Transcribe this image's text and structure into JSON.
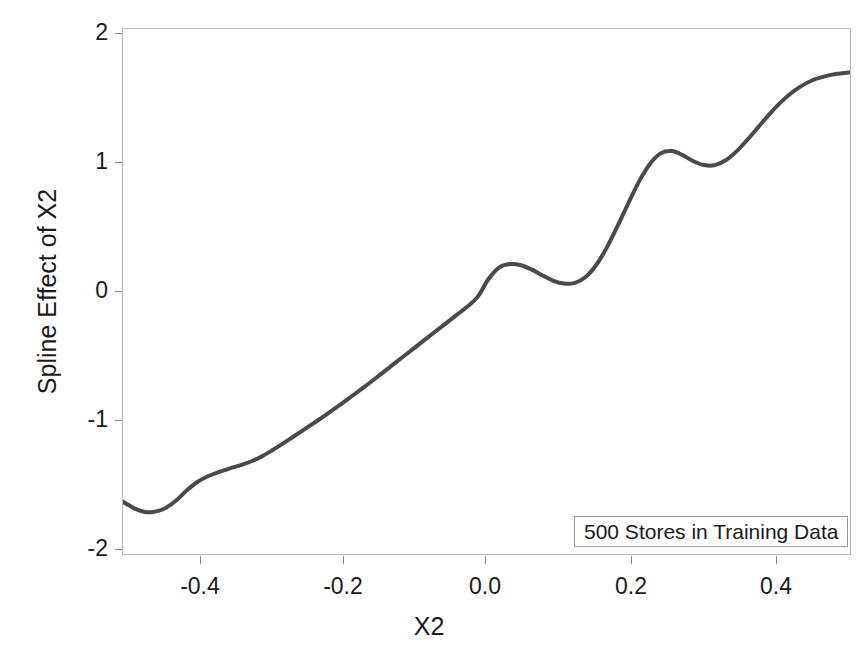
{
  "chart_data": {
    "type": "line",
    "title": "",
    "subtitle": "",
    "xlabel": "X2",
    "ylabel": "Spline Effect of X2",
    "xlim": [
      -0.504,
      0.508
    ],
    "ylim": [
      -2.08,
      2.04
    ],
    "xticks": [
      -0.4,
      -0.2,
      0.0,
      0.2,
      0.4
    ],
    "xticklabels": [
      "-0.4",
      "-0.2",
      "0.0",
      "0.2",
      "0.4"
    ],
    "yticks": [
      2,
      1,
      0,
      -1,
      -2
    ],
    "yticklabels": [
      "2",
      "1",
      "0",
      "-1",
      "-2"
    ],
    "grid": false,
    "legend_position": "bottom-right",
    "annotation": "500 Stores in Training Data",
    "line_color": "#4a4a4a",
    "line_width": 4,
    "frame_color": "#b9b9b9",
    "background_color": "#ffffff",
    "series": [
      {
        "name": "Spline Effect of X2",
        "x": [
          -0.504,
          -0.495,
          -0.485,
          -0.475,
          -0.465,
          -0.455,
          -0.445,
          -0.43,
          -0.415,
          -0.4,
          -0.385,
          -0.37,
          -0.355,
          -0.34,
          -0.325,
          -0.31,
          -0.295,
          -0.28,
          -0.265,
          -0.25,
          -0.235,
          -0.22,
          -0.205,
          -0.19,
          -0.175,
          -0.16,
          -0.145,
          -0.13,
          -0.115,
          -0.1,
          -0.085,
          -0.07,
          -0.055,
          -0.04,
          -0.025,
          -0.01,
          0.005,
          0.02,
          0.035,
          0.05,
          0.065,
          0.08,
          0.095,
          0.11,
          0.125,
          0.14,
          0.155,
          0.17,
          0.185,
          0.2,
          0.215,
          0.23,
          0.245,
          0.26,
          0.275,
          0.29,
          0.305,
          0.32,
          0.335,
          0.35,
          0.365,
          0.38,
          0.395,
          0.41,
          0.425,
          0.44,
          0.455,
          0.47,
          0.485,
          0.508
        ],
        "y": [
          -1.67,
          -1.7,
          -1.73,
          -1.748,
          -1.752,
          -1.742,
          -1.72,
          -1.66,
          -1.58,
          -1.513,
          -1.468,
          -1.436,
          -1.408,
          -1.382,
          -1.352,
          -1.312,
          -1.262,
          -1.208,
          -1.152,
          -1.096,
          -1.04,
          -0.982,
          -0.922,
          -0.86,
          -0.798,
          -0.734,
          -0.668,
          -0.602,
          -0.536,
          -0.47,
          -0.404,
          -0.338,
          -0.272,
          -0.206,
          -0.14,
          -0.06,
          0.08,
          0.17,
          0.196,
          0.186,
          0.152,
          0.106,
          0.064,
          0.042,
          0.048,
          0.094,
          0.19,
          0.33,
          0.5,
          0.68,
          0.85,
          0.985,
          1.066,
          1.082,
          1.05,
          1.002,
          0.972,
          0.972,
          1.01,
          1.08,
          1.17,
          1.268,
          1.366,
          1.456,
          1.532,
          1.592,
          1.636,
          1.664,
          1.684,
          1.7
        ]
      }
    ]
  },
  "axes": {
    "y_title": "Spline Effect of X2",
    "x_title": "X2",
    "y_tick_labels": [
      "2",
      "1",
      "0",
      "-1",
      "-2"
    ],
    "x_tick_labels": [
      "-0.4",
      "-0.2",
      "0.0",
      "0.2",
      "0.4"
    ]
  },
  "legend": {
    "text": "500 Stores in Training Data"
  }
}
